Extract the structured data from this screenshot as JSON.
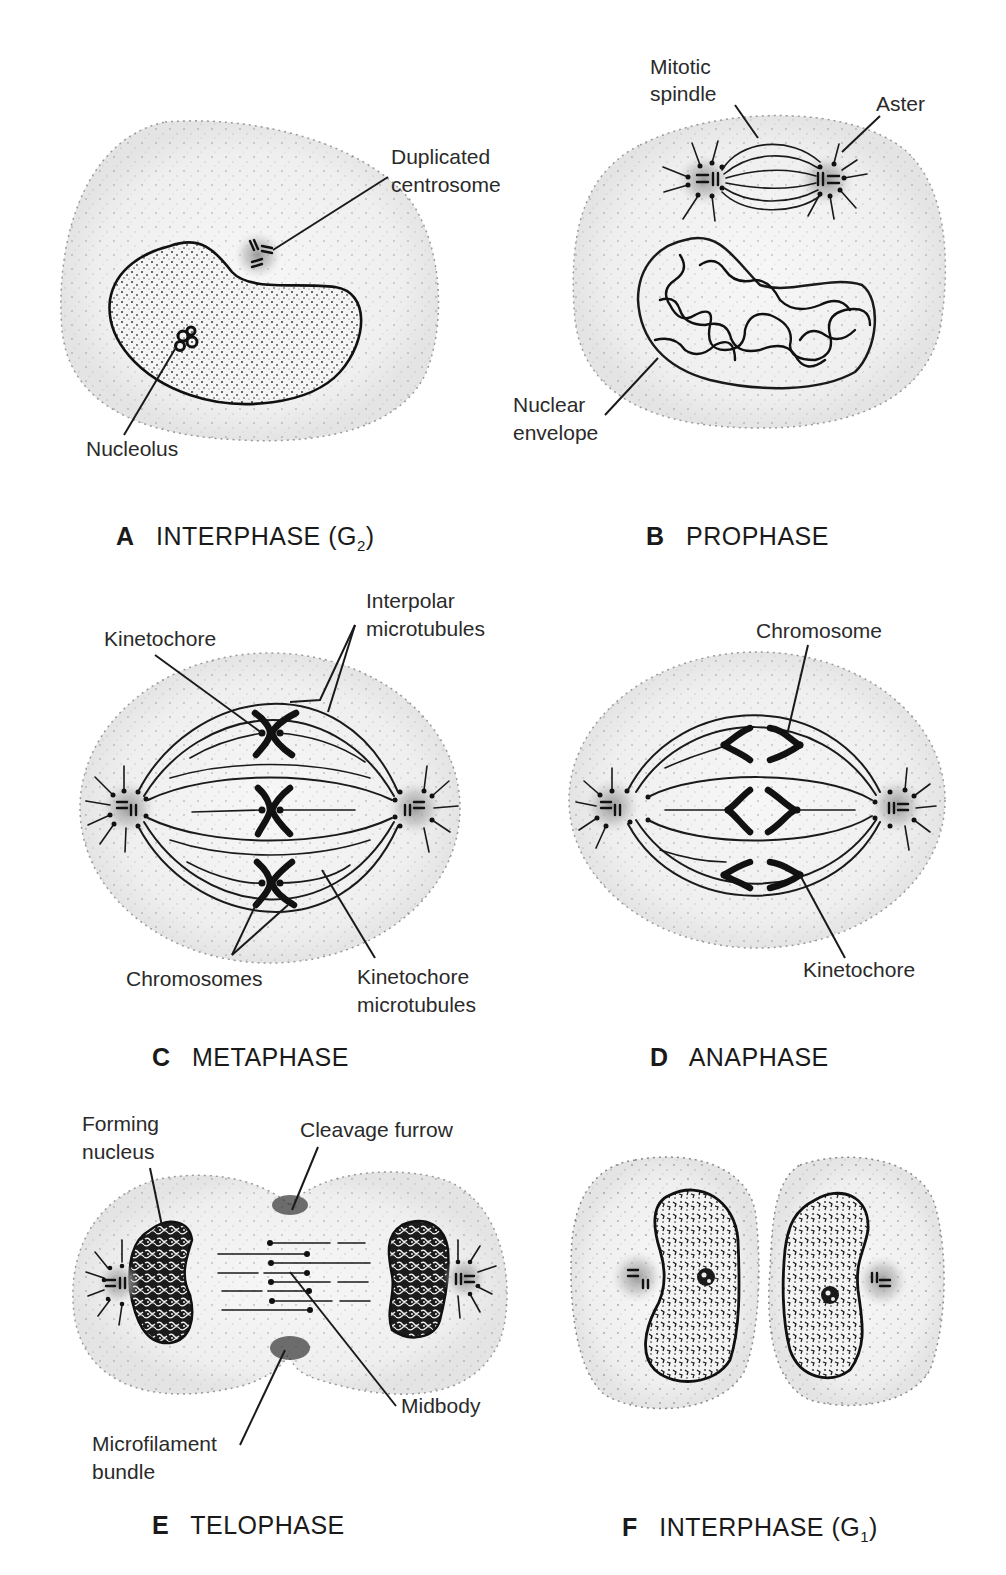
{
  "figure": {
    "panels": [
      {
        "letter": "A",
        "stage": "INTERPHASE (G",
        "subscript": "2",
        "stage_close": ")",
        "labels": [
          "Duplicated",
          "centrosome",
          "Nucleolus"
        ]
      },
      {
        "letter": "B",
        "stage": "PROPHASE",
        "labels": [
          "Mitotic",
          "spindle",
          "Aster",
          "Nuclear",
          "envelope"
        ]
      },
      {
        "letter": "C",
        "stage": "METAPHASE",
        "labels": [
          "Kinetochore",
          "Interpolar",
          "microtubules",
          "Chromosomes",
          "Kinetochore",
          "microtubules"
        ]
      },
      {
        "letter": "D",
        "stage": "ANAPHASE",
        "labels": [
          "Chromosome",
          "Kinetochore"
        ]
      },
      {
        "letter": "E",
        "stage": "TELOPHASE",
        "labels": [
          "Forming",
          "nucleus",
          "Cleavage furrow",
          "Midbody",
          "Microfilament",
          "bundle"
        ]
      },
      {
        "letter": "F",
        "stage": "INTERPHASE (G",
        "subscript": "1",
        "stage_close": ")",
        "labels": []
      }
    ]
  },
  "colors": {
    "ink": "#1a1a1a",
    "cytoplasm": "#f2f2f2",
    "centrosome_glow": "#9a9a9a",
    "background": "#ffffff"
  }
}
